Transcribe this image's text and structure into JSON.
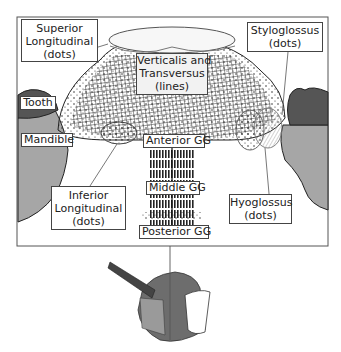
{
  "diagram": {
    "labels": {
      "superior_longitudinal": {
        "line1": "Superior",
        "line2": "Longitudinal",
        "line3": "(dots)"
      },
      "verticalis_transversus": {
        "line1": "Verticalis and",
        "line2": "Transversus",
        "line3": "(lines)"
      },
      "styloglossus": {
        "line1": "Styloglossus",
        "line2": "(dots)"
      },
      "tooth": "Tooth",
      "mandible": "Mandible",
      "anterior_gg": "Anterior GG",
      "middle_gg": "Middle GG",
      "posterior_gg": "Posterior GG",
      "inferior_longitudinal": {
        "line1": "Inferior",
        "line2": "Longitudinal",
        "line3": "(dots)"
      },
      "hyoglossus": {
        "line1": "Hyoglossus",
        "line2": "(dots)"
      }
    },
    "colors": {
      "bone": "#a6a6a6",
      "tooth": "#555555",
      "fiber": "#222222",
      "frame": "#555555",
      "inset_tongue": "#7a7a7a"
    },
    "inset": {
      "description": "3D tongue model with mid-sagittal cut line"
    }
  }
}
